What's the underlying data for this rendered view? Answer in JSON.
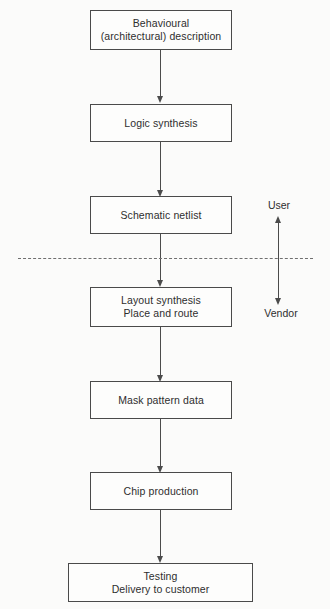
{
  "diagram": {
    "background_color": "#fbfbfa",
    "line_color": "#4b4b4b",
    "text_color": "#2e2e2e",
    "boxes": [
      {
        "id": "behavioural-description",
        "line1": "Behavioural",
        "line2": "(architectural) description"
      },
      {
        "id": "logic-synthesis",
        "line1": "Logic synthesis",
        "line2": ""
      },
      {
        "id": "schematic-netlist",
        "line1": "Schematic netlist",
        "line2": ""
      },
      {
        "id": "layout-synthesis",
        "line1": "Layout synthesis",
        "line2": "Place and route"
      },
      {
        "id": "mask-pattern-data",
        "line1": "Mask pattern data",
        "line2": ""
      },
      {
        "id": "chip-production",
        "line1": "Chip production",
        "line2": ""
      },
      {
        "id": "testing-delivery",
        "line1": "Testing",
        "line2": "Delivery to customer"
      }
    ],
    "boundary": {
      "upper_label": "User",
      "lower_label": "Vendor"
    },
    "caption": ""
  }
}
